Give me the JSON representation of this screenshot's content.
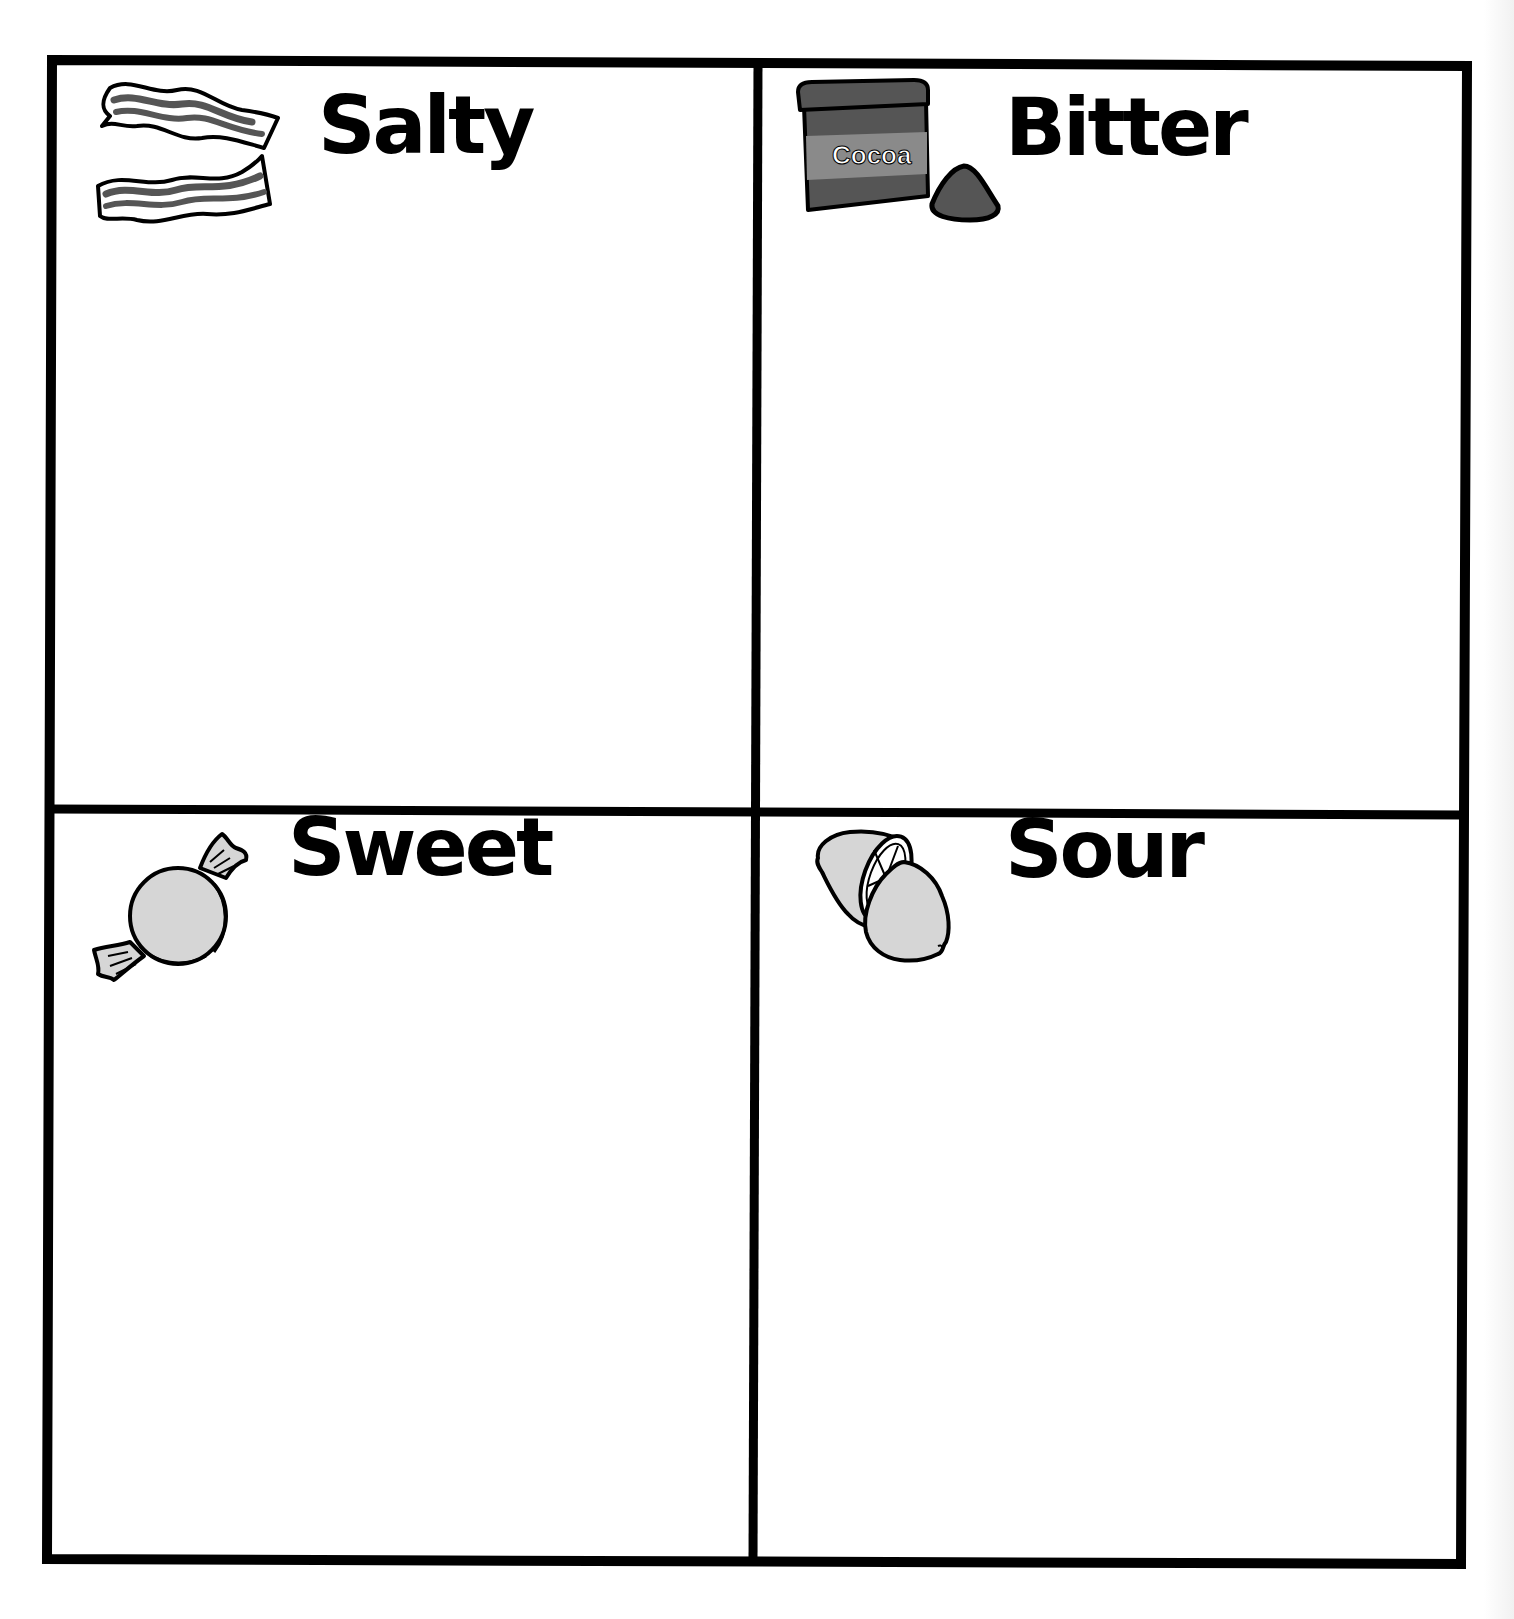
{
  "worksheet": {
    "quadrants": [
      {
        "id": "salty",
        "label": "Salty",
        "icon": "bacon-icon"
      },
      {
        "id": "bitter",
        "label": "Bitter",
        "icon": "cocoa-tin-icon",
        "icon_text": "Cocoa"
      },
      {
        "id": "sweet",
        "label": "Sweet",
        "icon": "wrapped-candy-icon"
      },
      {
        "id": "sour",
        "label": "Sour",
        "icon": "lemon-icon"
      }
    ]
  },
  "colors": {
    "line": "#000000",
    "fill_dark": "#555555",
    "fill_mid": "#8a8a8a",
    "fill_light": "#d6d6d6",
    "background": "#ffffff"
  }
}
